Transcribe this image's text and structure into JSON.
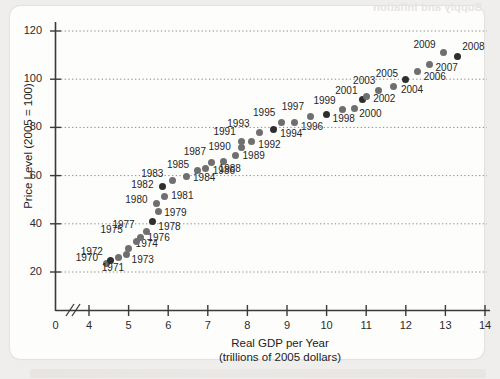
{
  "figure": {
    "ghost_text": "Supply and Inflation",
    "axes": {
      "y_title": "Price Level (2005 = 100)",
      "x_title_line1": "Real GDP per Year",
      "x_title_line2": "(trillions of 2005 dollars)",
      "y_ticks": [
        20,
        40,
        60,
        80,
        100,
        120
      ],
      "x_ticks": [
        0,
        4,
        5,
        6,
        7,
        8,
        9,
        10,
        11,
        12,
        13,
        14
      ],
      "x_axis_break": true,
      "grid": "horizontal-dotted"
    }
  },
  "chart_data": {
    "type": "scatter",
    "title": "",
    "xlabel": "Real GDP per Year (trillions of 2005 dollars)",
    "ylabel": "Price Level (2005 = 100)",
    "xlim": [
      4,
      14
    ],
    "ylim": [
      20,
      120
    ],
    "xticks": [
      4,
      5,
      6,
      7,
      8,
      9,
      10,
      11,
      12,
      13,
      14
    ],
    "yticks": [
      20,
      40,
      60,
      80,
      100,
      120
    ],
    "grid": true,
    "legend": "none",
    "point_label_key": "year",
    "points": [
      {
        "year": "1970",
        "x": 4.45,
        "y": 23.5,
        "lx": -31,
        "ly": -6,
        "dark": false
      },
      {
        "year": "1971",
        "x": 4.55,
        "y": 24.8,
        "lx": -9,
        "ly": 8,
        "dark": true
      },
      {
        "year": "1972",
        "x": 4.75,
        "y": 26.0,
        "lx": -38,
        "ly": -6,
        "dark": false
      },
      {
        "year": "1973",
        "x": 4.95,
        "y": 27.3,
        "lx": 5,
        "ly": 6,
        "dark": false
      },
      {
        "year": "1974",
        "x": 5.0,
        "y": 29.8,
        "lx": 7,
        "ly": -4,
        "dark": false
      },
      {
        "year": "1975",
        "x": 5.2,
        "y": 32.5,
        "lx": -36,
        "ly": -12,
        "dark": false
      },
      {
        "year": "1976",
        "x": 5.3,
        "y": 34.5,
        "lx": 7,
        "ly": 1,
        "dark": false
      },
      {
        "year": "1977",
        "x": 5.45,
        "y": 36.8,
        "lx": -34,
        "ly": -7,
        "dark": false
      },
      {
        "year": "1978",
        "x": 5.6,
        "y": 40.8,
        "lx": 6,
        "ly": 5,
        "dark": true
      },
      {
        "year": "1979",
        "x": 5.75,
        "y": 45.2,
        "lx": 6,
        "ly": 2,
        "dark": false
      },
      {
        "year": "1980",
        "x": 5.7,
        "y": 48.5,
        "lx": -31,
        "ly": -3,
        "dark": false
      },
      {
        "year": "1981",
        "x": 5.9,
        "y": 51.5,
        "lx": 7,
        "ly": 0,
        "dark": false
      },
      {
        "year": "1982",
        "x": 5.85,
        "y": 55.3,
        "lx": -31,
        "ly": -2,
        "dark": true
      },
      {
        "year": "1983",
        "x": 6.1,
        "y": 58.0,
        "lx": -31,
        "ly": -6,
        "dark": false
      },
      {
        "year": "1984",
        "x": 6.45,
        "y": 59.8,
        "lx": 7,
        "ly": 2,
        "dark": false
      },
      {
        "year": "1985",
        "x": 6.75,
        "y": 62.0,
        "lx": -31,
        "ly": -6,
        "dark": false
      },
      {
        "year": "1986",
        "x": 6.95,
        "y": 62.8,
        "lx": 7,
        "ly": 2,
        "dark": false
      },
      {
        "year": "1987",
        "x": 7.1,
        "y": 65.5,
        "lx": -28,
        "ly": -10,
        "dark": false
      },
      {
        "year": "1988",
        "x": 7.4,
        "y": 66.0,
        "lx": -5,
        "ly": 8,
        "dark": false
      },
      {
        "year": "1989",
        "x": 7.7,
        "y": 68.5,
        "lx": 7,
        "ly": 1,
        "dark": false
      },
      {
        "year": "1990",
        "x": 7.85,
        "y": 71.5,
        "lx": -33,
        "ly": -1,
        "dark": false
      },
      {
        "year": "1991",
        "x": 7.85,
        "y": 74.3,
        "lx": -28,
        "ly": -9,
        "dark": false
      },
      {
        "year": "1992",
        "x": 8.1,
        "y": 74.0,
        "lx": 7,
        "ly": 3,
        "dark": false
      },
      {
        "year": "1993",
        "x": 8.3,
        "y": 78.0,
        "lx": -32,
        "ly": -8,
        "dark": false
      },
      {
        "year": "1994",
        "x": 8.65,
        "y": 79.0,
        "lx": 7,
        "ly": 4,
        "dark": true
      },
      {
        "year": "1995",
        "x": 8.85,
        "y": 82.0,
        "lx": -28,
        "ly": -10,
        "dark": false
      },
      {
        "year": "1996",
        "x": 9.2,
        "y": 82.0,
        "lx": 6,
        "ly": 4,
        "dark": false
      },
      {
        "year": "1997",
        "x": 9.6,
        "y": 84.5,
        "lx": -29,
        "ly": -10,
        "dark": false
      },
      {
        "year": "1998",
        "x": 10.0,
        "y": 85.5,
        "lx": 6,
        "ly": 5,
        "dark": true
      },
      {
        "year": "1999",
        "x": 10.4,
        "y": 87.5,
        "lx": -29,
        "ly": -8,
        "dark": false
      },
      {
        "year": "2000",
        "x": 10.7,
        "y": 88.0,
        "lx": 5,
        "ly": 6,
        "dark": false
      },
      {
        "year": "2001",
        "x": 10.9,
        "y": 91.5,
        "lx": -27,
        "ly": -9,
        "dark": true
      },
      {
        "year": "2002",
        "x": 11.0,
        "y": 93.0,
        "lx": 7,
        "ly": 3,
        "dark": false
      },
      {
        "year": "2003",
        "x": 11.3,
        "y": 95.5,
        "lx": -25,
        "ly": -9,
        "dark": false
      },
      {
        "year": "2004",
        "x": 11.7,
        "y": 97.0,
        "lx": 7,
        "ly": 4,
        "dark": false
      },
      {
        "year": "2005",
        "x": 12.0,
        "y": 100.0,
        "lx": -30,
        "ly": -5,
        "dark": true
      },
      {
        "year": "2006",
        "x": 12.3,
        "y": 103.0,
        "lx": 6,
        "ly": 5,
        "dark": false
      },
      {
        "year": "2007",
        "x": 12.6,
        "y": 106.0,
        "lx": 6,
        "ly": 3,
        "dark": false
      },
      {
        "year": "2008",
        "x": 13.3,
        "y": 109.5,
        "lx": 5,
        "ly": -9,
        "dark": true
      },
      {
        "year": "2009",
        "x": 12.95,
        "y": 111.0,
        "lx": -30,
        "ly": -8,
        "dark": false
      }
    ]
  }
}
